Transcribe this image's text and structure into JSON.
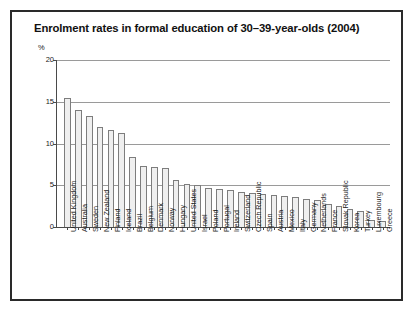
{
  "figure": {
    "title": "Enrolment rates in formal education of 30–39-year-olds (2004)",
    "unit_label": "%"
  },
  "chart_data": {
    "type": "bar",
    "title": "Enrolment rates in formal education of 30–39-year-olds (2004)",
    "xlabel": "",
    "ylabel": "%",
    "ylim": [
      0,
      20
    ],
    "yticks": [
      0,
      5,
      10,
      15,
      20
    ],
    "ytick_labels": [
      "0",
      "5",
      "10",
      "15",
      "20"
    ],
    "grid": true,
    "legend": "none",
    "categories": [
      "United Kingdom",
      "Australia",
      "Sweden",
      "New Zealand",
      "Finland",
      "Iceland",
      "Brazil",
      "Belgium",
      "Denmark",
      "Norway",
      "Hungary",
      "United States",
      "Israel",
      "Poland",
      "Portugal",
      "Ireland",
      "Switzerland",
      "Czech Republic",
      "Spain",
      "Austria",
      "Mexico",
      "Italy",
      "Germany",
      "Netherlands",
      "France",
      "Slovak Republic",
      "Korea",
      "Turkey",
      "Luxembourg",
      "Greece"
    ],
    "values": [
      15.5,
      14.0,
      13.3,
      12.0,
      11.6,
      11.3,
      8.4,
      7.3,
      7.2,
      7.1,
      5.6,
      5.2,
      5.0,
      4.7,
      4.6,
      4.4,
      4.2,
      4.1,
      3.9,
      3.8,
      3.7,
      3.6,
      3.4,
      3.2,
      2.7,
      2.5,
      2.2,
      1.9,
      0.8,
      0.7
    ]
  },
  "colors": {
    "bar_fill": "#efefef",
    "bar_edge": "#7d7d7d",
    "gridline": "#9a9a9a",
    "axis": "#4a4a4a",
    "frame": "#2a2a2a",
    "text": "#111111"
  }
}
